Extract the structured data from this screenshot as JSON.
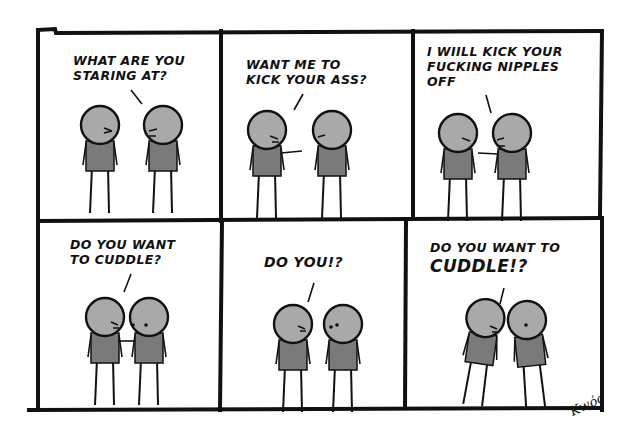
{
  "comic": {
    "panels": [
      {
        "id": 1,
        "row": 1,
        "caption": "What are you\nstaring at?",
        "scene": "two stick figures facing each other, left one angry, right one yelling"
      },
      {
        "id": 2,
        "row": 1,
        "caption": "Want me to\nkick your ass?",
        "scene": "left figure yelling and pointing at right figure"
      },
      {
        "id": 3,
        "row": 1,
        "caption": "I wiill kick your\nfucking nipples\noff",
        "scene": "right figure yelling and pointing at left figure"
      },
      {
        "id": 4,
        "row": 2,
        "caption": "Do you want\nto cuddle?",
        "scene": "left figure leaning in, poking right figure, right figure surprised"
      },
      {
        "id": 5,
        "row": 2,
        "caption": "Do you!?",
        "scene": "left figure yelling up close, right figure surprised"
      },
      {
        "id": 6,
        "row": 2,
        "caption_line1": "Do you want to",
        "caption_line2": "Cuddle!?",
        "scene": "both figures leaning together, left one shouting"
      }
    ],
    "signature": "Kwóo"
  },
  "colors": {
    "ink": "#111111",
    "head_fill": "#a9a9a9",
    "shirt_fill": "#7a7a7a",
    "paper": "#ffffff"
  }
}
